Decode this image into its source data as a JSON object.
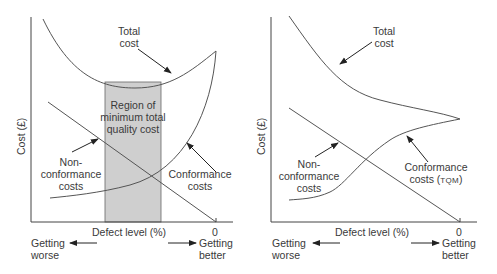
{
  "left_diagram": {
    "y_axis_label": "Cost (£)",
    "x_axis_label": "Defect level (%)",
    "zero_tick": "0",
    "total_cost_label": [
      "Total",
      "cost"
    ],
    "region_label": [
      "Region of",
      "minimum total",
      "quality cost"
    ],
    "nonconformance_label": [
      "Non-",
      "conformance",
      "costs"
    ],
    "conformance_label": [
      "Conformance",
      "costs"
    ],
    "worse_label": [
      "Getting",
      "worse"
    ],
    "better_label": [
      "Getting",
      "better"
    ],
    "region_fill": "#c8c8c8"
  },
  "right_diagram": {
    "y_axis_label": "Cost (£)",
    "x_axis_label": "Defect level (%)",
    "zero_tick": "0",
    "total_cost_label": [
      "Total",
      "cost"
    ],
    "nonconformance_label": [
      "Non-",
      "conformance",
      "costs"
    ],
    "conformance_label": [
      "Conformance",
      "costs (",
      "TQM",
      ")"
    ],
    "worse_label": [
      "Getting",
      "worse"
    ],
    "better_label": [
      "Getting",
      "better"
    ]
  },
  "colors": {
    "line": "#555555",
    "text": "#3a3a3a"
  }
}
